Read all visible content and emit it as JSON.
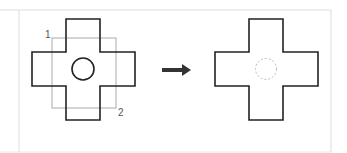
{
  "diagram": {
    "before": {
      "label_corner_1": "1",
      "label_corner_2": "2",
      "outline_color": "#222222",
      "selection_rect_color": "#aaaaaa",
      "hole": "solid circle"
    },
    "arrow": {
      "color": "#333333",
      "direction": "right"
    },
    "after": {
      "outline_color": "#222222",
      "hole": "dashed circle (removed)",
      "hole_color": "#bbbbbb"
    },
    "frame_color": "#dddddd"
  }
}
